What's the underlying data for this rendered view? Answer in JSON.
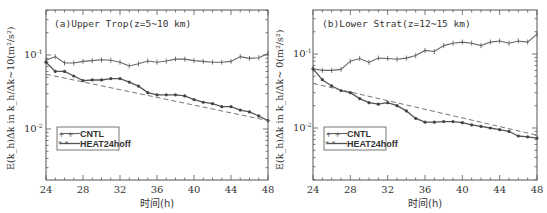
{
  "xaxis_label": "时间(h)",
  "ylabel": "E(k_h)Δk in k_h/Δk~10(m²/s²)",
  "legend": {
    "cntl": "CNTL",
    "heat": "HEAT24hoff"
  },
  "colors": {
    "line": "#555555",
    "dashed": "#777777",
    "frame": "#555555"
  },
  "panels": [
    {
      "title": "(a)Upper Trop(z=5~10 km)",
      "ylabel_text": "E(k_h)Δk in k_h/Δk~10(m²/s²)"
    },
    {
      "title": "(b)Lower Strat(z=12~15 km)",
      "ylabel_text": "E(k_h)Δk in k_h/Δk~ 0(m²/s²)"
    }
  ],
  "chart_data": [
    {
      "type": "line",
      "title": "(a)Upper Trop(z=5~10 km)",
      "xlabel": "时间(h)",
      "ylabel": "E(k_h)Δk in k_h/Δk~10(m²/s²)",
      "yscale": "log",
      "xlim": [
        24,
        48
      ],
      "ylim": [
        0.002,
        0.41
      ],
      "xticks": [
        24,
        28,
        32,
        36,
        40,
        44,
        48
      ],
      "yticks": [
        "10^-1",
        "10^-2"
      ],
      "grid": false,
      "legend_position": "lower left",
      "x": [
        24,
        25,
        26,
        27,
        28,
        29,
        30,
        31,
        32,
        33,
        34,
        35,
        36,
        37,
        38,
        39,
        40,
        41,
        42,
        43,
        44,
        45,
        46,
        47,
        48
      ],
      "series": [
        {
          "name": "CNTL",
          "marker": "+",
          "values": [
            0.085,
            0.095,
            0.078,
            0.078,
            0.082,
            0.084,
            0.086,
            0.085,
            0.08,
            0.071,
            0.076,
            0.083,
            0.08,
            0.083,
            0.088,
            0.088,
            0.084,
            0.082,
            0.08,
            0.08,
            0.082,
            0.095,
            0.09,
            0.092,
            0.105
          ]
        },
        {
          "name": "HEAT24hoff",
          "marker": "*",
          "values": [
            0.08,
            0.06,
            0.06,
            0.052,
            0.045,
            0.046,
            0.046,
            0.048,
            0.048,
            0.043,
            0.038,
            0.031,
            0.029,
            0.029,
            0.029,
            0.028,
            0.025,
            0.023,
            0.022,
            0.02,
            0.02,
            0.018,
            0.017,
            0.015,
            0.013
          ]
        },
        {
          "name": "trend (dashed)",
          "style": "dashed",
          "x": [
            24,
            48
          ],
          "values": [
            0.055,
            0.013
          ]
        }
      ]
    },
    {
      "type": "line",
      "title": "(b)Lower Strat(z=12~15 km)",
      "xlabel": "时间(h)",
      "ylabel": "E(k_h)Δk in k_h/Δk~ 0(m²/s²)",
      "yscale": "log",
      "xlim": [
        24,
        48
      ],
      "ylim": [
        0.002,
        0.41
      ],
      "xticks": [
        24,
        28,
        32,
        36,
        40,
        44,
        48
      ],
      "yticks": [
        "10^-1",
        "10^-2"
      ],
      "grid": false,
      "legend_position": "lower left",
      "x": [
        24,
        25,
        26,
        27,
        28,
        29,
        30,
        31,
        32,
        33,
        34,
        35,
        36,
        37,
        38,
        39,
        40,
        41,
        42,
        43,
        44,
        45,
        46,
        47,
        48
      ],
      "series": [
        {
          "name": "CNTL",
          "marker": "+",
          "values": [
            0.063,
            0.06,
            0.06,
            0.062,
            0.08,
            0.087,
            0.077,
            0.088,
            0.087,
            0.085,
            0.088,
            0.095,
            0.112,
            0.108,
            0.13,
            0.14,
            0.145,
            0.14,
            0.13,
            0.145,
            0.15,
            0.14,
            0.15,
            0.145,
            0.185
          ]
        },
        {
          "name": "HEAT24hoff",
          "marker": "*",
          "values": [
            0.063,
            0.045,
            0.037,
            0.032,
            0.03,
            0.025,
            0.022,
            0.021,
            0.022,
            0.02,
            0.017,
            0.0135,
            0.012,
            0.012,
            0.0122,
            0.0122,
            0.0118,
            0.011,
            0.0105,
            0.01,
            0.0095,
            0.009,
            0.0078,
            0.0076,
            0.0073
          ]
        },
        {
          "name": "trend (dashed)",
          "style": "dashed",
          "x": [
            24,
            48
          ],
          "values": [
            0.04,
            0.008
          ]
        }
      ]
    }
  ]
}
